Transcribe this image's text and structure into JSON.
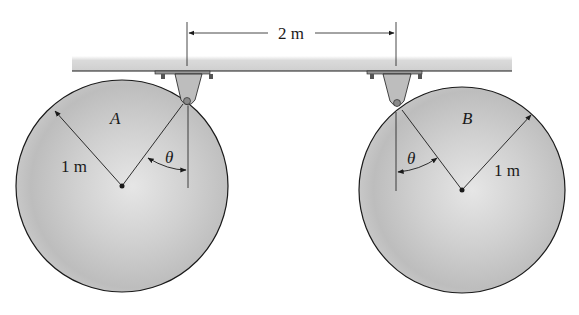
{
  "diagram": {
    "dimension": {
      "label": "2 m"
    },
    "disk_a": {
      "label": "A",
      "radius_label": "1 m",
      "angle_label": "θ"
    },
    "disk_b": {
      "label": "B",
      "radius_label": "1 m",
      "angle_label": "θ"
    },
    "colors": {
      "disk_fill": "#c9c9c9",
      "beam_fill": "#d4d4d4",
      "line": "#1a1a1a",
      "bracket": "#bdbdbd"
    }
  }
}
